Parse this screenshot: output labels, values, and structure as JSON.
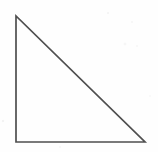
{
  "figure": {
    "name": "right-triangle",
    "caption": "",
    "canvas": {
      "width": 158,
      "height": 152,
      "background_color": "#fefefe"
    },
    "style": {
      "stroke_color": "#4f4f4f",
      "stroke_width": 1.7,
      "fill": "none",
      "line_join": "miter"
    },
    "shape": {
      "type": "polygon",
      "sides": 3,
      "closed": true,
      "right_angle_at": "bottom-left",
      "vertices": [
        {
          "label": "apex",
          "x": 16,
          "y": 16
        },
        {
          "label": "bottom-left",
          "x": 16,
          "y": 142
        },
        {
          "label": "bottom-right",
          "x": 145,
          "y": 142
        }
      ],
      "edges": [
        {
          "name": "vertical-leg",
          "from": "apex",
          "to": "bottom-left",
          "orientation": "vertical",
          "length_px": 126
        },
        {
          "name": "horizontal-leg",
          "from": "bottom-left",
          "to": "bottom-right",
          "orientation": "horizontal",
          "length_px": 129
        },
        {
          "name": "hypotenuse",
          "from": "bottom-right",
          "to": "apex",
          "orientation": "diagonal",
          "length_px": 180
        }
      ]
    }
  }
}
